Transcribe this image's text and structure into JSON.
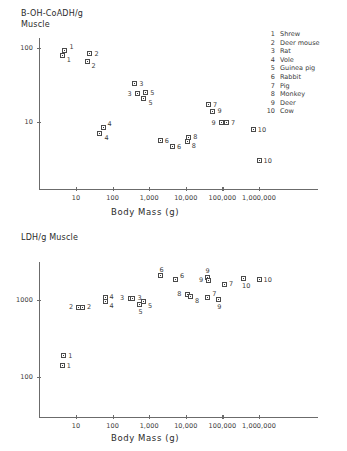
{
  "figure": {
    "xlabel": "Body Mass (g)"
  },
  "legend": {
    "items": [
      {
        "num": "1",
        "name": "Shrew"
      },
      {
        "num": "2",
        "name": "Deer mouse"
      },
      {
        "num": "3",
        "name": "Rat"
      },
      {
        "num": "4",
        "name": "Vole"
      },
      {
        "num": "5",
        "name": "Guinea pig"
      },
      {
        "num": "6",
        "name": "Rabbit"
      },
      {
        "num": "7",
        "name": "Pig"
      },
      {
        "num": "8",
        "name": "Monkey"
      },
      {
        "num": "9",
        "name": "Deer"
      },
      {
        "num": "10",
        "name": "Cow"
      }
    ]
  },
  "chart_data": [
    {
      "id": "boh-coadh",
      "type": "scatter",
      "title": "B-OH-CoADH/g\nMuscle",
      "xlabel": "Body Mass (g)",
      "ylabel": "B-OH-CoADH/g Muscle",
      "xscale": "log",
      "yscale": "log",
      "xlim": [
        1.6,
        6500000
      ],
      "ylim": [
        1.7,
        230
      ],
      "xticks": [
        10,
        100,
        1000,
        10000,
        100000,
        1000000
      ],
      "xticklabels": [
        "10",
        "100",
        "1,000",
        "10,000",
        "100,000",
        "1,000,000"
      ],
      "yticks": [
        10,
        100
      ],
      "yticklabels": [
        "10",
        "100"
      ],
      "grid": false,
      "legend_position": "right",
      "points": [
        {
          "label": "1",
          "x": 5.0,
          "y": 93,
          "lpos": "right-up"
        },
        {
          "label": "1",
          "x": 4.2,
          "y": 80,
          "lpos": "right-down"
        },
        {
          "label": "2",
          "x": 24,
          "y": 83,
          "lpos": "right"
        },
        {
          "label": "2",
          "x": 20,
          "y": 66,
          "lpos": "right-down"
        },
        {
          "label": "3",
          "x": 400,
          "y": 33,
          "lpos": "right"
        },
        {
          "label": "3",
          "x": 480,
          "y": 24,
          "lpos": "left"
        },
        {
          "label": "5",
          "x": 800,
          "y": 25,
          "lpos": "right"
        },
        {
          "label": "5",
          "x": 720,
          "y": 21,
          "lpos": "right-down"
        },
        {
          "label": "4",
          "x": 55,
          "y": 8.3,
          "lpos": "right-up"
        },
        {
          "label": "4",
          "x": 45,
          "y": 7.0,
          "lpos": "right-down"
        },
        {
          "label": "7",
          "x": 42000,
          "y": 17,
          "lpos": "right"
        },
        {
          "label": "9",
          "x": 55000,
          "y": 14,
          "lpos": "right"
        },
        {
          "label": "9",
          "x": 95000,
          "y": 9.8,
          "lpos": "left"
        },
        {
          "label": "7",
          "x": 130000,
          "y": 9.8,
          "lpos": "right"
        },
        {
          "label": "10",
          "x": 700000,
          "y": 7.8,
          "lpos": "right"
        },
        {
          "label": "6",
          "x": 2000,
          "y": 5.6,
          "lpos": "right"
        },
        {
          "label": "6",
          "x": 4300,
          "y": 4.6,
          "lpos": "right"
        },
        {
          "label": "8",
          "x": 12000,
          "y": 6.2,
          "lpos": "right"
        },
        {
          "label": "8",
          "x": 11000,
          "y": 5.5,
          "lpos": "right-down"
        },
        {
          "label": "10",
          "x": 1000000,
          "y": 3.0,
          "lpos": "right"
        }
      ]
    },
    {
      "id": "ldh",
      "type": "scatter",
      "title": "LDH/g Muscle",
      "xlabel": "Body Mass (g)",
      "ylabel": "LDH/g Muscle",
      "xscale": "log",
      "yscale": "log",
      "xlim": [
        1.6,
        6500000
      ],
      "ylim": [
        48,
        4300
      ],
      "xticks": [
        10,
        100,
        1000,
        10000,
        100000,
        1000000
      ],
      "xticklabels": [
        "10",
        "100",
        "1,000",
        "10,000",
        "100,000",
        "1,000,000"
      ],
      "yticks": [
        100,
        1000
      ],
      "yticklabels": [
        "100",
        "1000"
      ],
      "grid": false,
      "legend_position": "none",
      "points": [
        {
          "label": "6",
          "x": 2100,
          "y": 2050,
          "lpos": "up"
        },
        {
          "label": "6",
          "x": 5200,
          "y": 1820,
          "lpos": "right-up"
        },
        {
          "label": "9",
          "x": 38000,
          "y": 1960,
          "lpos": "up"
        },
        {
          "label": "9",
          "x": 43000,
          "y": 1800,
          "lpos": "left"
        },
        {
          "label": "7",
          "x": 115000,
          "y": 1600,
          "lpos": "right"
        },
        {
          "label": "10",
          "x": 380000,
          "y": 1900,
          "lpos": "down"
        },
        {
          "label": "10",
          "x": 1000000,
          "y": 1820,
          "lpos": "right"
        },
        {
          "label": "8",
          "x": 11000,
          "y": 1180,
          "lpos": "left"
        },
        {
          "label": "8",
          "x": 13500,
          "y": 1100,
          "lpos": "right-down"
        },
        {
          "label": "7",
          "x": 40000,
          "y": 1080,
          "lpos": "right-up"
        },
        {
          "label": "9",
          "x": 80000,
          "y": 1030,
          "lpos": "down"
        },
        {
          "label": "4",
          "x": 62,
          "y": 1080,
          "lpos": "right"
        },
        {
          "label": "4",
          "x": 62,
          "y": 960,
          "lpos": "right-down"
        },
        {
          "label": "3",
          "x": 300,
          "y": 1060,
          "lpos": "left"
        },
        {
          "label": "3",
          "x": 360,
          "y": 1060,
          "lpos": "right"
        },
        {
          "label": "5",
          "x": 700,
          "y": 970,
          "lpos": "right-down"
        },
        {
          "label": "5",
          "x": 560,
          "y": 880,
          "lpos": "down"
        },
        {
          "label": "2",
          "x": 12,
          "y": 800,
          "lpos": "left"
        },
        {
          "label": "2",
          "x": 15,
          "y": 800,
          "lpos": "right"
        },
        {
          "label": "1",
          "x": 4.6,
          "y": 190,
          "lpos": "right"
        },
        {
          "label": "1",
          "x": 4.2,
          "y": 140,
          "lpos": "right"
        }
      ]
    }
  ]
}
